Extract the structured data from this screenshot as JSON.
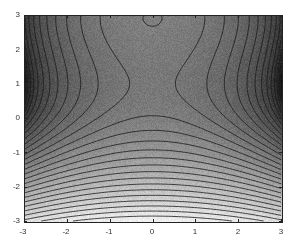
{
  "chart_data": {
    "type": "contour",
    "title": "",
    "xlabel": "",
    "ylabel": "",
    "xlim": [
      -3,
      3
    ],
    "ylim": [
      -3,
      3
    ],
    "x_ticks": [
      -3,
      -2,
      -1,
      0,
      1,
      2,
      3
    ],
    "y_ticks": [
      -3,
      -2,
      -1,
      0,
      1,
      2,
      3
    ],
    "x_tick_labels": [
      "-3",
      "-2",
      "-1",
      "0",
      "1",
      "2",
      "3"
    ],
    "y_tick_labels": [
      "-3",
      "-2",
      "-1",
      "0",
      "1",
      "2",
      "3"
    ],
    "grid": false,
    "legend": null,
    "colormap": "gray",
    "shading": "filled background with black contour lines",
    "function_description": "saddle surface with saddle point near (0, 1); dark (low) at left/right edges near y=1, light (high) at bottom center, dense contours toward y=-3",
    "function_model": {
      "a_x2": -1.0,
      "b_y2": 1.0,
      "c_y3": 0.35,
      "y_center": 1.0
    },
    "saddle_point": [
      0,
      1
    ],
    "contour_levels": 30,
    "grid_resolution": 80
  },
  "colors": {
    "frame": "#222222",
    "contour_line": "#1a1a1a",
    "tick_text": "#333333",
    "low": "#0a0a0a",
    "high": "#f2f2f2"
  }
}
